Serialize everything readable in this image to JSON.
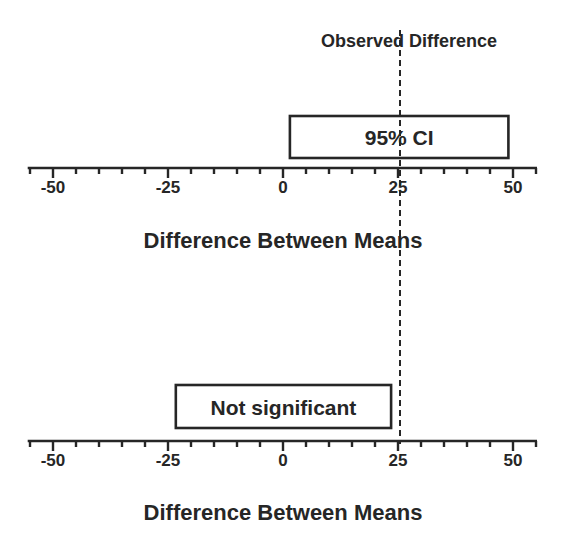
{
  "chart_data": {
    "type": "interval",
    "title": "",
    "reference_line": {
      "value": 25,
      "label": "Observed Difference",
      "style": "dashed"
    },
    "panels": [
      {
        "name": "significant",
        "xlabel": "Difference Between Means",
        "xlim": [
          -55.5,
          55
        ],
        "major_ticks": [
          -50,
          -25,
          0,
          25,
          50
        ],
        "tick_labels": [
          "-50",
          "-25",
          "0",
          "25",
          "50"
        ],
        "minor_tick_step": 5,
        "interval": {
          "label": "95% CI",
          "low": 1.5,
          "high": 49
        }
      },
      {
        "name": "not-significant",
        "xlabel": "Difference Between Means",
        "xlim": [
          -55.5,
          55
        ],
        "major_ticks": [
          -50,
          -25,
          0,
          25,
          50
        ],
        "tick_labels": [
          "-50",
          "-25",
          "0",
          "25",
          "50"
        ],
        "minor_tick_step": 5,
        "interval": {
          "label": "Not significant",
          "low": -23.3,
          "high": 23.5
        }
      }
    ]
  }
}
